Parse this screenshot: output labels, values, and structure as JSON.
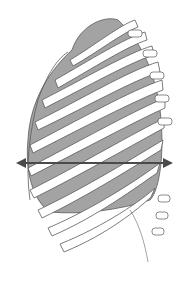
{
  "figure": {
    "colors": {
      "background": "#ffffff",
      "lung": "#a3a3a3",
      "rib_fill": "#ffffff",
      "outline": "#5a5a5a",
      "arrow": "#4a4a4a",
      "spine": "#d8d8d8"
    },
    "arrow": {
      "direction": "horizontal-bidirectional",
      "x1": 18,
      "x2": 172,
      "y": 163
    }
  }
}
